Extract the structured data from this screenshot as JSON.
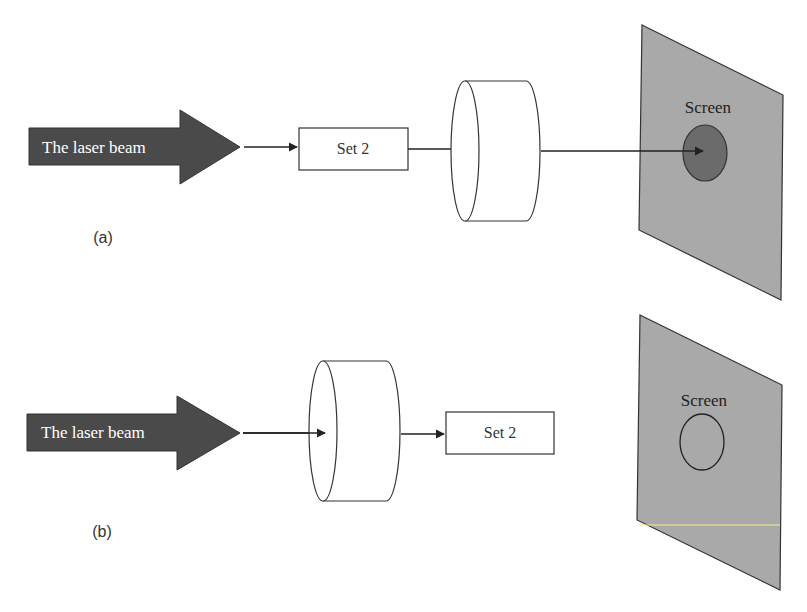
{
  "panels": [
    {
      "id": "a",
      "caption": "(a)",
      "beam_label": "The laser beam",
      "box_label": "Set 2",
      "screen_label": "Screen",
      "order": [
        "laser-beam",
        "set-2",
        "cylinder",
        "screen"
      ],
      "spot": "filled-dark"
    },
    {
      "id": "b",
      "caption": "(b)",
      "beam_label": "The laser beam",
      "box_label": "Set 2",
      "screen_label": "Screen",
      "order": [
        "laser-beam",
        "cylinder",
        "set-2",
        "screen"
      ],
      "spot": "outline-only"
    }
  ],
  "colors": {
    "beam_fill": "#4a4a4a",
    "beam_text": "#ffffff",
    "screen_fill": "#a9a9a9",
    "spot_fill": "#6b6b6b",
    "line": "#222222",
    "highlight_line": "#f5f08a"
  }
}
